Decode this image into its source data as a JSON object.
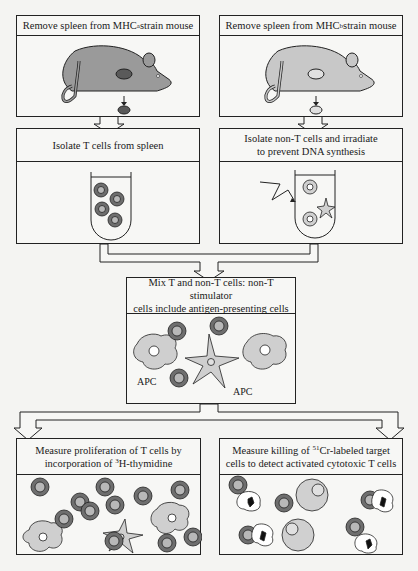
{
  "diagram": {
    "steps": {
      "mouse_a": {
        "text_pre": "Remove spleen from MHC",
        "sup": "a",
        "text_post": " strain mouse"
      },
      "mouse_b": {
        "text_pre": "Remove spleen from MHC",
        "sup": "b",
        "text_post": " strain mouse"
      },
      "isolate_t": {
        "text": "Isolate T cells from spleen"
      },
      "isolate_nont": {
        "line1": "Isolate non-T cells and irradiate",
        "line2": "to prevent DNA synthesis"
      },
      "mix": {
        "line1": "Mix T and non-T cells: non-T stimulator",
        "line2": "cells include antigen-presenting cells"
      },
      "proliferation": {
        "line1": "Measure proliferation of T cells by",
        "line2_pre": "incorporation of ",
        "sup": "3",
        "line2_post": "H-thymidine"
      },
      "killing": {
        "line1_pre": "Measure killing of ",
        "sup": "51",
        "line1_post": "Cr-labeled target",
        "line2": "cells to detect activated cytotoxic T cells"
      }
    },
    "labels": {
      "apc_left": "APC",
      "apc_right": "APC"
    },
    "colors": {
      "mouse_a": "#9a9a9a",
      "mouse_b": "#c8c8c8",
      "t_cell_outer": "#6e6e6e",
      "t_cell_inner": "#b8b8b8",
      "apc_fill": "#cfcfcf",
      "target_cell": "#d0d0d0",
      "stroke": "#222222"
    }
  }
}
